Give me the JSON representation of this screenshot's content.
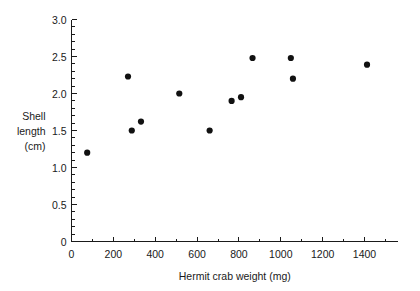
{
  "chart_data": {
    "type": "scatter",
    "title": "",
    "xlabel": "Hermit crab weight (mg)",
    "ylabel": "Shell length (cm)",
    "ylabel_lines": [
      "Shell",
      "length",
      "(cm)"
    ],
    "xlim": [
      0,
      1560
    ],
    "ylim": [
      0,
      3.0
    ],
    "x_major_ticks": [
      0,
      200,
      400,
      600,
      800,
      1000,
      1200,
      1400
    ],
    "x_tick_labels": [
      "0",
      "200",
      "400",
      "600",
      "800",
      "1000",
      "1200",
      "1400"
    ],
    "x_minor_step": 100,
    "y_major_ticks": [
      0,
      0.5,
      1.0,
      1.5,
      2.0,
      2.5,
      3.0
    ],
    "y_tick_labels": [
      "0",
      "0.5",
      "1.0",
      "1.5",
      "2.0",
      "2.5",
      "3.0"
    ],
    "y_minor_step": 0.1,
    "grid": false,
    "legend": false,
    "marker": "filled-circle",
    "marker_color": "#111111",
    "axis_color": "#1a1a1a",
    "background": "#ffffff",
    "points": [
      {
        "x": 75,
        "y": 1.2
      },
      {
        "x": 270,
        "y": 2.23
      },
      {
        "x": 288,
        "y": 1.5
      },
      {
        "x": 332,
        "y": 1.62
      },
      {
        "x": 515,
        "y": 2.0
      },
      {
        "x": 660,
        "y": 1.5
      },
      {
        "x": 765,
        "y": 1.9
      },
      {
        "x": 810,
        "y": 1.95
      },
      {
        "x": 865,
        "y": 2.48
      },
      {
        "x": 1048,
        "y": 2.48
      },
      {
        "x": 1058,
        "y": 2.2
      },
      {
        "x": 1412,
        "y": 2.39
      }
    ]
  },
  "figure": {
    "alt_description": "Scatter plot of shell length versus hermit crab weight"
  }
}
